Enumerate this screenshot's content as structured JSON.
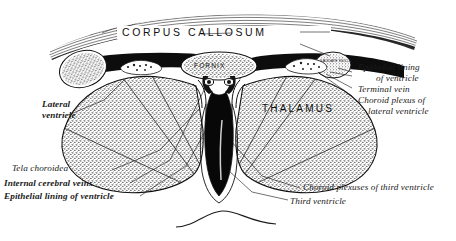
{
  "figure": {
    "background_color": "#ffffff",
    "ink_color": "#111111"
  },
  "structure_titles": {
    "corpus_callosum": "CORPUS  CALLOSUM",
    "thalamus": "THALAMUS",
    "fornix": "FORNIX",
    "caudate_nucleus": "CAUDATE NUCL."
  },
  "labels_left": [
    {
      "id": "lateral-ventricle",
      "line1": "Lateral",
      "line2": "ventricle"
    },
    {
      "id": "tela-choroidea",
      "line1": "Tela choroidea",
      "line2": ""
    },
    {
      "id": "internal-cerebral-veins",
      "line1": "Internal cerebral veins",
      "line2": ""
    },
    {
      "id": "epithelial-lining-of-ventricle",
      "line1": "Epithelial lining of ventricle",
      "line2": ""
    }
  ],
  "labels_right": [
    {
      "id": "epithelial-lining-of-ventricle-right",
      "line1": "Epithelial lining",
      "line2": "of ventricle"
    },
    {
      "id": "terminal-vein",
      "line1": "Terminal vein",
      "line2": ""
    },
    {
      "id": "choroid-plexus-of-lateral-ventricle",
      "line1": "Choroid plexus of",
      "line2": "lateral ventricle"
    }
  ],
  "labels_bottom": [
    {
      "id": "choroid-plexuses-of-third-ventricle",
      "line1": "Choroid plexuses of third ventricle"
    },
    {
      "id": "third-ventricle",
      "line1": "Third ventricle"
    }
  ]
}
